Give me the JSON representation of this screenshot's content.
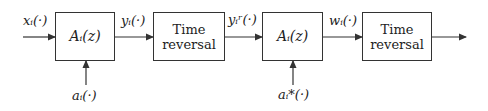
{
  "diagram": {
    "blocks": [
      {
        "id": "allpass1",
        "label": "A_i(z)",
        "display": "Aᵢ(z)"
      },
      {
        "id": "timerev1",
        "label": "Time reversal",
        "line1": "Time",
        "line2": "reversal"
      },
      {
        "id": "allpass2",
        "label": "A_i(z)",
        "display": "Aᵢ(z)"
      },
      {
        "id": "timerev2",
        "label": "Time reversal",
        "line1": "Time",
        "line2": "reversal"
      }
    ],
    "signals": {
      "input": "xᵢ(·)",
      "after_allpass1": "yᵢ(·)",
      "after_timerev1": "yᵢʳ(·)",
      "after_allpass2": "wᵢ(·)"
    },
    "coefficients": {
      "allpass1": "aᵢ(·)",
      "allpass2": "aᵢ*(·)"
    }
  }
}
